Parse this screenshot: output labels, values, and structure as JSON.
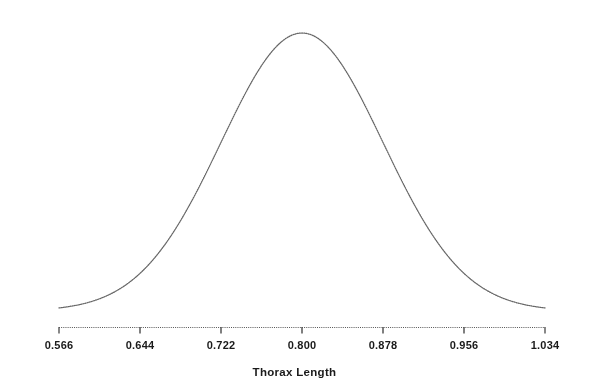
{
  "chart_data": {
    "type": "line",
    "title": "",
    "subtitle": "",
    "xlabel": "Thorax Length",
    "ylabel": "",
    "curve": "normal-density",
    "distribution": {
      "mean": 0.8,
      "sd": 0.078
    },
    "xlim": [
      0.566,
      1.034
    ],
    "ylim": [
      0,
      1
    ],
    "grid": false,
    "legend": null,
    "tick_labels": [
      "0.566",
      "0.644",
      "0.722",
      "0.800",
      "0.878",
      "0.956",
      "1.034"
    ],
    "tick_values": [
      0.566,
      0.644,
      0.722,
      0.8,
      0.878,
      0.956,
      1.034
    ],
    "tick_step": 0.078,
    "x": [
      0.566,
      0.5894,
      0.6128,
      0.6362,
      0.6596,
      0.683,
      0.7064,
      0.7298,
      0.7532,
      0.7766,
      0.8,
      0.8234,
      0.8468,
      0.8702,
      0.8936,
      0.917,
      0.9404,
      0.9638,
      0.9872,
      1.0106,
      1.034
    ],
    "values": [
      0.0111,
      0.0273,
      0.0608,
      0.1227,
      0.2242,
      0.3716,
      0.558,
      0.7596,
      0.937,
      1.0485,
      1.0607,
      1.0485,
      0.937,
      0.7596,
      0.558,
      0.3716,
      0.2242,
      0.1227,
      0.0608,
      0.0273,
      0.0111
    ],
    "values_normalized": [
      0.0105,
      0.0258,
      0.0573,
      0.1157,
      0.2114,
      0.3503,
      0.5261,
      0.7161,
      0.8834,
      0.9886,
      1.0,
      0.9886,
      0.8834,
      0.7161,
      0.5261,
      0.3503,
      0.2114,
      0.1157,
      0.0573,
      0.0258,
      0.0105
    ],
    "colors": {
      "curve": "#666666",
      "axis": "#555555",
      "text": "#1a1a1a",
      "background": "#ffffff"
    },
    "line_style": "dotted",
    "axis_line_style": "dotted"
  }
}
